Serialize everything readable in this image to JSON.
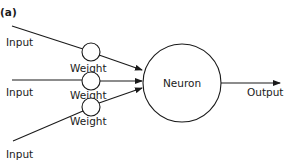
{
  "panel_label": "(a)",
  "inputs": [
    {
      "label": "Input",
      "weight_label": "Weight"
    },
    {
      "label": "Input",
      "weight_label": "Weight"
    },
    {
      "label": "Input",
      "weight_label": "Weight"
    }
  ],
  "neuron": {
    "label": "Neuron"
  },
  "output": {
    "label": "Output"
  },
  "colors": {
    "stroke": "#1a1a1a",
    "background": "#ffffff"
  }
}
